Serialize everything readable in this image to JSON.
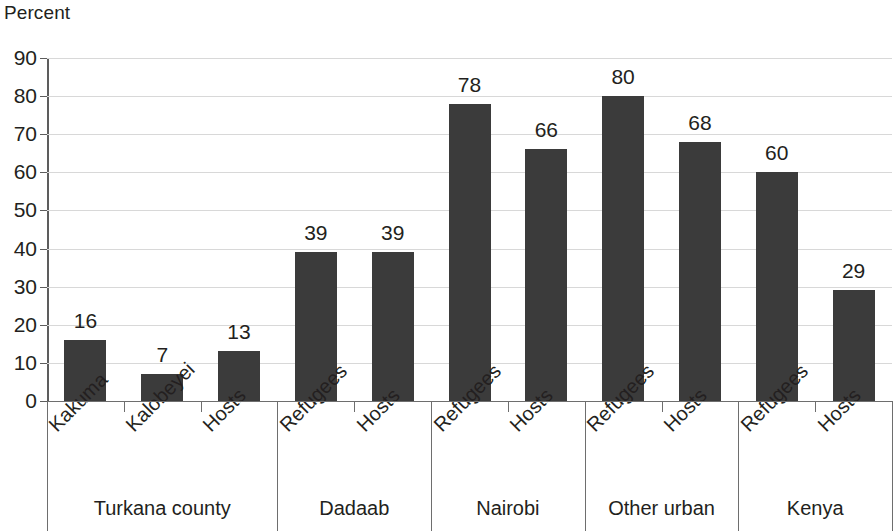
{
  "chart_data": {
    "type": "bar",
    "title": "",
    "subtitle": "",
    "xlabel": "",
    "ylabel": "Percent",
    "ylim": [
      0,
      90
    ],
    "ytick_step": 10,
    "yticks": [
      90,
      80,
      70,
      60,
      50,
      40,
      30,
      20,
      10,
      0
    ],
    "grid": true,
    "legend": "none",
    "bar_color": "#3b3b3b",
    "gridline_color": "#d8d8d8",
    "axis_color": "#5d5d5d",
    "categories": [
      "Kakuma",
      "Kalobeyei",
      "Hosts",
      "Refugees",
      "Hosts",
      "Refugees",
      "Hosts",
      "Refugees",
      "Hosts",
      "Refugees",
      "Hosts"
    ],
    "values": [
      16,
      7,
      13,
      39,
      39,
      78,
      66,
      80,
      68,
      60,
      29
    ],
    "data_labels": [
      "16",
      "7",
      "13",
      "39",
      "39",
      "78",
      "66",
      "80",
      "68",
      "60",
      "29"
    ],
    "groups": [
      {
        "label": "Turkana county",
        "span": 3
      },
      {
        "label": "Dadaab",
        "span": 2
      },
      {
        "label": "Nairobi",
        "span": 2
      },
      {
        "label": "Other urban",
        "span": 2
      },
      {
        "label": "Kenya",
        "span": 2
      }
    ]
  }
}
